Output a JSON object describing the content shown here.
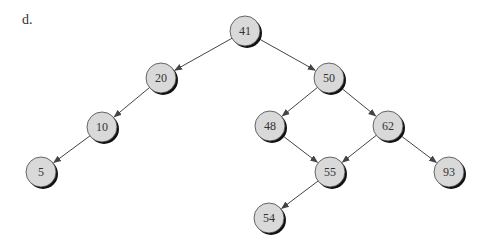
{
  "label": "d.",
  "colors": {
    "node_fill": "#d9d9d9",
    "node_stroke": "#444444",
    "node_shadow": "#111111",
    "edge": "#444444",
    "text": "#333333"
  },
  "nodes": [
    {
      "id": "n41",
      "value": "41",
      "x": 245,
      "y": 31
    },
    {
      "id": "n20",
      "value": "20",
      "x": 161,
      "y": 78
    },
    {
      "id": "n50",
      "value": "50",
      "x": 329,
      "y": 78
    },
    {
      "id": "n10",
      "value": "10",
      "x": 102,
      "y": 127
    },
    {
      "id": "n48",
      "value": "48",
      "x": 270,
      "y": 126
    },
    {
      "id": "n62",
      "value": "62",
      "x": 388,
      "y": 126
    },
    {
      "id": "n5",
      "value": "5",
      "x": 41,
      "y": 172
    },
    {
      "id": "n55",
      "value": "55",
      "x": 330,
      "y": 172
    },
    {
      "id": "n93",
      "value": "93",
      "x": 449,
      "y": 172
    },
    {
      "id": "n54",
      "value": "54",
      "x": 269,
      "y": 218
    }
  ],
  "edges": [
    {
      "from": "n41",
      "to": "n20"
    },
    {
      "from": "n41",
      "to": "n50"
    },
    {
      "from": "n20",
      "to": "n10"
    },
    {
      "from": "n10",
      "to": "n5"
    },
    {
      "from": "n50",
      "to": "n48"
    },
    {
      "from": "n50",
      "to": "n62"
    },
    {
      "from": "n48",
      "to": "n55"
    },
    {
      "from": "n62",
      "to": "n55"
    },
    {
      "from": "n62",
      "to": "n93"
    },
    {
      "from": "n55",
      "to": "n54"
    }
  ],
  "node_radius": 15
}
